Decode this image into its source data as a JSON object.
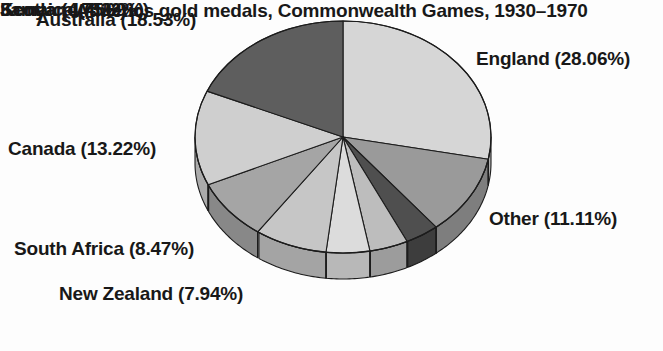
{
  "caption": "Athletics gold medals, Commonwealth Games, 1930–1970",
  "labels": {
    "australia": "Australia (18.53%)",
    "england": "England (28.06%)",
    "canada": "Canada (13.22%)",
    "south_africa": "South Africa (8.47%)",
    "new_zealand": "New Zealand (7.94%)",
    "other": "Other (11.11%)",
    "scotland": "Scotland (3.69%)",
    "jamaica": "Jamaica (4.22%)",
    "kenya": "Kenya (4.75%)"
  },
  "geometry": {
    "cx": 343,
    "cy": 137,
    "rx": 148,
    "ry": 116,
    "depth": 26,
    "start_angle_deg": -90
  },
  "chart_data": {
    "type": "pie",
    "title": "Athletics gold medals, Commonwealth Games, 1930–1970",
    "xlabel": "",
    "ylabel": "",
    "legend": "none (direct slice labels)",
    "grid": false,
    "units": "percent",
    "categories": [
      "England",
      "Other",
      "Scotland",
      "Jamaica",
      "Kenya",
      "New Zealand",
      "South Africa",
      "Canada",
      "Australia"
    ],
    "values": [
      28.06,
      11.11,
      3.69,
      4.22,
      4.75,
      7.94,
      8.47,
      13.22,
      18.53
    ],
    "slices": [
      {
        "name": "England",
        "value": 28.06,
        "label": "England (28.06%)",
        "color": "#d6d6d6",
        "side_color": "#b2b2b2"
      },
      {
        "name": "Other",
        "value": 11.11,
        "label": "Other (11.11%)",
        "color": "#9a9a9a",
        "side_color": "#7e7e7e"
      },
      {
        "name": "Scotland",
        "value": 3.69,
        "label": "Scotland (3.69%)",
        "color": "#4f4f4f",
        "side_color": "#3d3d3d"
      },
      {
        "name": "Jamaica",
        "value": 4.22,
        "label": "Jamaica (4.22%)",
        "color": "#bdbdbd",
        "side_color": "#9c9c9c"
      },
      {
        "name": "Kenya",
        "value": 4.75,
        "label": "Kenya (4.75%)",
        "color": "#dcdcdc",
        "side_color": "#b8b8b8"
      },
      {
        "name": "New Zealand",
        "value": 7.94,
        "label": "New Zealand (7.94%)",
        "color": "#c6c6c6",
        "side_color": "#a4a4a4"
      },
      {
        "name": "South Africa",
        "value": 8.47,
        "label": "South Africa (8.47%)",
        "color": "#a5a5a5",
        "side_color": "#888888"
      },
      {
        "name": "Canada",
        "value": 13.22,
        "label": "Canada (13.22%)",
        "color": "#cfcfcf",
        "side_color": "#ababab"
      },
      {
        "name": "Australia",
        "value": 18.53,
        "label": "Australia (18.53%)",
        "color": "#5e5e5e",
        "side_color": "#494949"
      }
    ]
  },
  "style": {
    "background": "#fdfdfd",
    "outline": "#1c1c1c",
    "text_color": "#181818"
  }
}
